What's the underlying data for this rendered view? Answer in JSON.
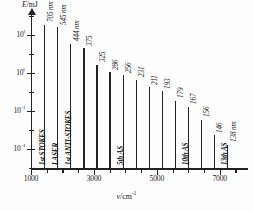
{
  "chart_data": {
    "type": "bar",
    "title": "",
    "xlabel": "v/cm⁻¹",
    "ylabel": "E/mJ",
    "xlabel_symbol": "v",
    "xlabel_unit": "cm",
    "xlabel_unit_exp": "-1",
    "ylabel_symbol": "E",
    "ylabel_unit": "mJ",
    "x_axis": {
      "min": 1000,
      "max": 7900,
      "major_ticks": [
        1000,
        3000,
        5000,
        7000
      ],
      "major_tick_labels": [
        "1000",
        "3000",
        "5000",
        "7000"
      ],
      "minor_tick_step": 500,
      "grid": false
    },
    "y_axis": {
      "scale": "log",
      "min_exp": -5,
      "max_exp": 3,
      "major_tick_labels": [
        "10²",
        "10⁰",
        "10⁻²",
        "10⁻⁴"
      ],
      "major_tick_exponents": [
        2,
        0,
        -2,
        -4
      ],
      "grid": false
    },
    "legend": {
      "visible": false
    },
    "points": [
      {
        "x": 1420,
        "energy_exp": 2.55,
        "label": "705 nm",
        "order_label": "1st STOKES",
        "has_order": true
      },
      {
        "x": 1835,
        "energy_exp": 2.4,
        "label": "545 nm",
        "order_label": "LASER",
        "has_order": true
      },
      {
        "x": 2250,
        "energy_exp": 1.55,
        "label": "444 nm",
        "order_label": "1st ANTI-STOKES",
        "has_order": true
      },
      {
        "x": 2665,
        "energy_exp": 1.3,
        "label": "375",
        "order_label": "",
        "has_order": false
      },
      {
        "x": 3080,
        "energy_exp": 0.45,
        "label": "325",
        "order_label": "",
        "has_order": false
      },
      {
        "x": 3495,
        "energy_exp": 0.05,
        "label": "286",
        "order_label": "",
        "has_order": false
      },
      {
        "x": 3910,
        "energy_exp": -0.1,
        "label": "256",
        "order_label": "5th AS",
        "has_order": true
      },
      {
        "x": 4325,
        "energy_exp": -0.35,
        "label": "231",
        "order_label": "",
        "has_order": false
      },
      {
        "x": 4740,
        "energy_exp": -0.75,
        "label": "211",
        "order_label": "",
        "has_order": false
      },
      {
        "x": 5155,
        "energy_exp": -0.95,
        "label": "193",
        "order_label": "",
        "has_order": false
      },
      {
        "x": 5570,
        "energy_exp": -1.45,
        "label": "179",
        "order_label": "",
        "has_order": false
      },
      {
        "x": 5985,
        "energy_exp": -1.75,
        "label": "167",
        "order_label": "10th AS",
        "has_order": true
      },
      {
        "x": 6400,
        "energy_exp": -2.45,
        "label": "156",
        "order_label": "",
        "has_order": false
      },
      {
        "x": 6815,
        "energy_exp": -3.25,
        "label": "146",
        "order_label": "",
        "has_order": false
      },
      {
        "x": 7230,
        "energy_exp": -3.75,
        "label": "138 nm",
        "order_label": "13th AS",
        "has_order": true
      }
    ]
  }
}
